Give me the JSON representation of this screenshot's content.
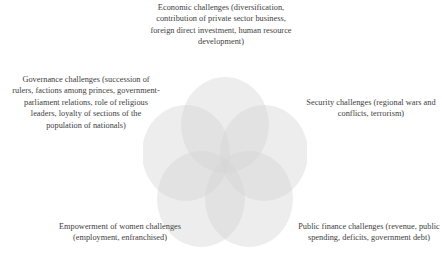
{
  "diagram": {
    "type": "venn",
    "set_count": 5,
    "background_color": "#ffffff",
    "circle_fill_color": "#d4d4d4",
    "circle_opacity": 0.42,
    "text_color": "#3d3d3d",
    "title": "",
    "labels": {
      "economic": "Economic challenges (diversification, contribution of private sector business, foreign direct investment, human resource development)",
      "governance": "Governance challenges (succession of rulers, factions among princes, government-parliament relations, role of religious leaders, loyalty of sections of the population of nationals)",
      "security": "Security challenges (regional wars and conflicts, terrorism)",
      "empowerment": "Empowerment of women challenges (employment, enfranchised)",
      "public_finance": "Public finance challenges (revenue, public spending, deficits, government debt)"
    },
    "sets": [
      {
        "id": "economic",
        "position": "top",
        "label": "Economic challenges (diversification, contribution of private sector business, foreign direct investment, human resource development)"
      },
      {
        "id": "governance",
        "position": "upper-left",
        "label": "Governance challenges (succession of rulers, factions among princes, government-parliament relations, role of religious leaders, loyalty of sections of the population of nationals)"
      },
      {
        "id": "security",
        "position": "upper-right",
        "label": "Security challenges (regional wars and conflicts, terrorism)"
      },
      {
        "id": "empowerment",
        "position": "lower-left",
        "label": "Empowerment of women challenges (employment, enfranchised)"
      },
      {
        "id": "public_finance",
        "position": "lower-right",
        "label": "Public finance challenges (revenue, public spending, deficits, government debt)"
      }
    ]
  }
}
